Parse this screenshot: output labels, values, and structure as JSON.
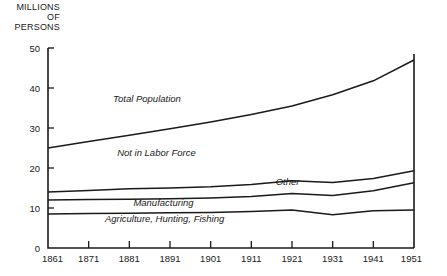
{
  "chart_data": {
    "type": "area",
    "title": "MILLIONS\nOF\nPERSONS",
    "ylabel": "MILLIONS OF PERSONS",
    "xlabel": "",
    "ylim": [
      0,
      50
    ],
    "xlim": [
      1861,
      1951
    ],
    "yticks": [
      "0",
      "10",
      "20",
      "30",
      "40",
      "50"
    ],
    "ytick_values": [
      0,
      10,
      20,
      30,
      40,
      50
    ],
    "grid": false,
    "legend": "inline-labels",
    "x": [
      1861,
      1871,
      1881,
      1891,
      1901,
      1911,
      1921,
      1931,
      1941,
      1951
    ],
    "xtick_labels": [
      "1861",
      "1871",
      "1881",
      "1891",
      "1901",
      "1911",
      "1921",
      "1931",
      "1941",
      "1951"
    ],
    "boundaries": [
      {
        "name": "Total Population",
        "label": "Total Population",
        "values": [
          25.0,
          26.6,
          28.2,
          29.8,
          31.5,
          33.4,
          35.5,
          38.3,
          41.8,
          47.0
        ]
      },
      {
        "name": "Labor Force Total",
        "label": "Other",
        "values": [
          14.0,
          14.4,
          14.8,
          15.0,
          15.3,
          15.9,
          16.8,
          16.4,
          17.4,
          19.3
        ]
      },
      {
        "name": "Manufacturing Upper",
        "label": "Manufacturing",
        "values": [
          12.0,
          12.1,
          12.2,
          12.3,
          12.5,
          12.9,
          13.6,
          13.1,
          14.3,
          16.3
        ]
      },
      {
        "name": "Agriculture, Hunting, Fishing",
        "label": "Agriculture, Hunting, Fishing",
        "values": [
          8.5,
          8.6,
          8.7,
          8.8,
          8.9,
          9.1,
          9.5,
          8.3,
          9.3,
          9.5
        ]
      }
    ],
    "bands": [
      {
        "name": "Not in Labor Force",
        "label": "Not in Labor Force"
      },
      {
        "name": "Other",
        "label": "Other"
      },
      {
        "name": "Manufacturing",
        "label": "Manufacturing"
      },
      {
        "name": "Agriculture, Hunting, Fishing",
        "label": "Agriculture, Hunting, Fishing"
      }
    ],
    "annotations": [
      {
        "text": "Total Population",
        "x": 1877,
        "y": 36.5
      },
      {
        "text": "Not in Labor Force",
        "x": 1878,
        "y": 23.0
      },
      {
        "text": "Other",
        "x": 1917,
        "y": 15.8
      },
      {
        "text": "Manufacturing",
        "x": 1882,
        "y": 10.5
      },
      {
        "text": "Agriculture, Hunting, Fishing",
        "x": 1875,
        "y": 6.5
      }
    ],
    "line_color": "#1a1a1a",
    "background_color": "#ffffff"
  }
}
